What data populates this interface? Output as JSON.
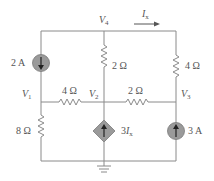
{
  "diagram": {
    "type": "circuit",
    "colors": {
      "wire": "#8a8a8a",
      "source_fill": "#9a9a9a",
      "text": "#555555",
      "arrow": "#222222"
    },
    "nodes": {
      "v1": {
        "var": "V",
        "sub": "1"
      },
      "v2": {
        "var": "V",
        "sub": "2"
      },
      "v3": {
        "var": "V",
        "sub": "3"
      },
      "v4": {
        "var": "V",
        "sub": "4"
      }
    },
    "current_label": {
      "var": "I",
      "sub": "x"
    },
    "components": {
      "source_2a": {
        "label": "2 A",
        "type": "independent current source",
        "direction": "down"
      },
      "r_top_mid": {
        "label": "2 Ω",
        "between": "V4-V2"
      },
      "r_top_right": {
        "label": "4 Ω",
        "between": "V4-V3"
      },
      "r_mid_left": {
        "label": "4 Ω",
        "between": "V1-V2"
      },
      "r_mid_right": {
        "label": "2 Ω",
        "between": "V2-V3"
      },
      "r_left_bottom": {
        "label": "8 Ω",
        "between": "V1-ground"
      },
      "dep_source": {
        "label_coef": "3",
        "label_var": "I",
        "label_sub": "x",
        "type": "dependent current source",
        "direction": "up"
      },
      "source_3a": {
        "label": "3 A",
        "type": "independent current source",
        "direction": "up"
      }
    }
  }
}
